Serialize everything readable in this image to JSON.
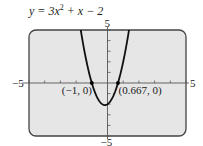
{
  "chart_data": {
    "type": "line",
    "equation": "y = 3x² + x − 2",
    "xlim": [
      -5,
      5
    ],
    "ylim": [
      -5,
      5
    ],
    "grid": false,
    "tick_labels": {
      "x_min": "−5",
      "x_max": "5",
      "y_min": "−5",
      "y_max": "5"
    },
    "annotations": [
      {
        "x": -1,
        "y": 0,
        "label": "(−1, 0)"
      },
      {
        "x": 0.667,
        "y": 0,
        "label": "(0.667, 0)"
      }
    ],
    "series": [
      {
        "name": "y = 3x^2 + x - 2",
        "function": "3x^2 + x - 2"
      }
    ],
    "colors": {
      "screen": "#e6e6e6",
      "curve": "#111111",
      "frame": "#444444"
    }
  }
}
